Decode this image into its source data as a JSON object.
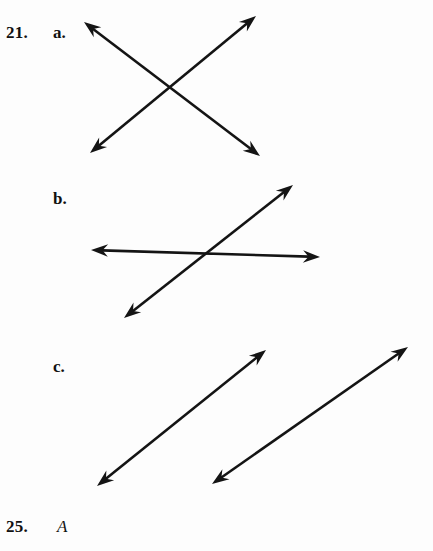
{
  "page": {
    "width": 433,
    "height": 551,
    "background_color": "#fdfdfd",
    "ink_color": "#141414"
  },
  "problems": {
    "current": {
      "number": "21.",
      "parts": [
        {
          "key": "a",
          "label": "a."
        },
        {
          "key": "b",
          "label": "b."
        },
        {
          "key": "c",
          "label": "c."
        }
      ]
    },
    "next": {
      "number": "25.",
      "point_label": "A"
    }
  },
  "figures": [
    {
      "part": "a",
      "name": "intersecting-lines-x",
      "description": "Two double-headed arrows crossing near their midpoints forming an X",
      "lines": [
        {
          "name": "line-upper-left-to-lower-right",
          "x1": 84,
          "y1": 22,
          "x2": 260,
          "y2": 156,
          "arrow_start": true,
          "arrow_end": true
        },
        {
          "name": "line-lower-left-to-upper-right",
          "x1": 90,
          "y1": 153,
          "x2": 256,
          "y2": 16,
          "arrow_start": true,
          "arrow_end": true
        }
      ]
    },
    {
      "part": "b",
      "name": "intersecting-lines-oblique",
      "description": "A nearly horizontal double-headed arrow crossed by an upward sloping double-headed arrow",
      "lines": [
        {
          "name": "line-horizontal",
          "x1": 91,
          "y1": 250,
          "x2": 320,
          "y2": 257,
          "arrow_start": true,
          "arrow_end": true
        },
        {
          "name": "line-diagonal-rising",
          "x1": 124,
          "y1": 318,
          "x2": 293,
          "y2": 185,
          "arrow_start": true,
          "arrow_end": true
        }
      ]
    },
    {
      "part": "c",
      "name": "parallel-lines",
      "description": "Two parallel double-headed arrows both rising to the right",
      "lines": [
        {
          "name": "line-parallel-left",
          "x1": 97,
          "y1": 486,
          "x2": 266,
          "y2": 350,
          "arrow_start": true,
          "arrow_end": true
        },
        {
          "name": "line-parallel-right",
          "x1": 212,
          "y1": 484,
          "x2": 408,
          "y2": 347,
          "arrow_start": true,
          "arrow_end": true
        }
      ]
    }
  ]
}
